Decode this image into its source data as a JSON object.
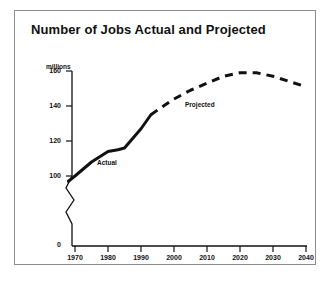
{
  "figure": {
    "title": "Number of Jobs Actual and Projected",
    "border_color": "#8c8c8c",
    "background": "#ffffff",
    "ink_color": "#111111"
  },
  "chart_data": {
    "type": "line",
    "title": "Number of Jobs Actual and Projected",
    "xlabel": "",
    "ylabel": "millions",
    "y_units_label": "millions",
    "xlim": [
      1965,
      2045
    ],
    "ylim": [
      0,
      168
    ],
    "y_axis_break": true,
    "y_break_between": [
      0,
      95
    ],
    "grid": false,
    "legend": "inline-annotations",
    "xticks": [
      "1970",
      "1980",
      "1990",
      "2000",
      "2010",
      "2020",
      "2030",
      "2040"
    ],
    "xtick_values": [
      1970,
      1980,
      1990,
      2000,
      2010,
      2020,
      2030,
      2040
    ],
    "yticks": [
      "0",
      "100",
      "120",
      "140",
      "160"
    ],
    "ytick_values": [
      0,
      100,
      120,
      140,
      160
    ],
    "series": [
      {
        "name": "Actual",
        "style": "solid",
        "annotation": "Actual",
        "x": [
          1968,
          1970,
          1975,
          1980,
          1983,
          1985,
          1990,
          1993
        ],
        "values": [
          97,
          100,
          108,
          114,
          115,
          116,
          127,
          135
        ]
      },
      {
        "name": "Projected",
        "style": "dashed",
        "annotation": "Projected",
        "x": [
          1993,
          1996,
          2000,
          2005,
          2010,
          2015,
          2020,
          2025,
          2030,
          2035,
          2040
        ],
        "values": [
          135,
          139,
          144,
          149,
          153,
          157,
          159,
          159,
          157,
          154,
          151
        ]
      }
    ]
  }
}
